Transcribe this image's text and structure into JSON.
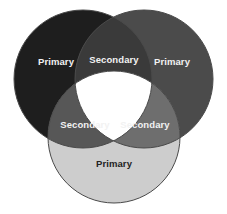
{
  "diagram": {
    "type": "venn",
    "background_color": "#ffffff",
    "stroke_color": "#4a4a4a",
    "regions": [
      {
        "id": "left-circle",
        "label": "Primary",
        "role": "primary",
        "fill": "#1e1e1e",
        "text_color": "#f2f2f2",
        "cx": 83,
        "cy": 79,
        "r": 69
      },
      {
        "id": "right-circle",
        "label": "Primary",
        "role": "primary",
        "fill": "#4b4b4b",
        "text_color": "#f2f2f2",
        "cx": 144,
        "cy": 79,
        "r": 69
      },
      {
        "id": "bottom-circle",
        "label": "Primary",
        "role": "primary",
        "fill": "#cdcdcd",
        "text_color": "#232323",
        "cx": 114,
        "cy": 137,
        "r": 66
      },
      {
        "id": "top-intersection",
        "label": "Secondary",
        "role": "secondary",
        "fill": "#3a3a3a",
        "text_color": "#f2f2f2"
      },
      {
        "id": "bottom-left-intersection",
        "label": "Secondary",
        "role": "secondary",
        "fill": "#575757",
        "text_color": "#f2f2f2"
      },
      {
        "id": "bottom-right-intersection",
        "label": "Secondary",
        "role": "secondary",
        "fill": "#6e6e6e",
        "text_color": "#f2f2f2"
      },
      {
        "id": "center-intersection",
        "label": "",
        "role": "tertiary",
        "fill": "#ffffff",
        "text_color": "#232323"
      }
    ],
    "labels": [
      {
        "id": "label-left-primary",
        "text": "Primary",
        "x": 56,
        "y": 62,
        "tone": "light"
      },
      {
        "id": "label-top-secondary",
        "text": "Secondary",
        "x": 114,
        "y": 60,
        "tone": "light"
      },
      {
        "id": "label-right-primary",
        "text": "Primary",
        "x": 172,
        "y": 62,
        "tone": "light"
      },
      {
        "id": "label-left-secondary",
        "text": "Secondary",
        "x": 85,
        "y": 125,
        "tone": "light"
      },
      {
        "id": "label-right-secondary",
        "text": "Secondary",
        "x": 145,
        "y": 125,
        "tone": "light"
      },
      {
        "id": "label-bottom-primary",
        "text": "Primary",
        "x": 114,
        "y": 164,
        "tone": "dark"
      }
    ]
  }
}
